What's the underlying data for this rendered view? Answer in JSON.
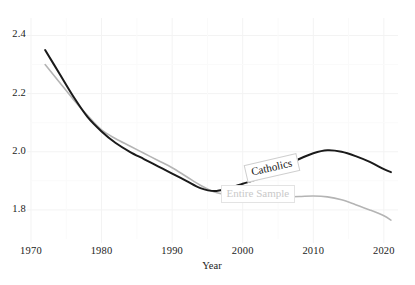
{
  "chart_data": {
    "type": "line",
    "title": "",
    "subtitle": "",
    "xlabel": "Year",
    "ylabel": "",
    "xlim": [
      1970,
      2022
    ],
    "ylim": [
      1.7,
      2.46
    ],
    "grid": true,
    "grid_style": "faint-light-gray",
    "legend_position": "inline-annotations",
    "xticks": [
      1970,
      1980,
      1990,
      2000,
      2010,
      2020
    ],
    "xtick_labels": [
      "1970",
      "1980",
      "1990",
      "2000",
      "2010",
      "2020"
    ],
    "yticks": [
      1.8,
      2.0,
      2.2,
      2.4
    ],
    "ytick_labels": [
      "1.8",
      "2.0",
      "2.2",
      "2.4"
    ],
    "series": [
      {
        "name": "Catholics",
        "color": "#1a1a1a",
        "linewidth": 2.0,
        "x": [
          1972,
          1974,
          1976,
          1978,
          1980,
          1982,
          1984,
          1986,
          1988,
          1990,
          1992,
          1994,
          1996,
          1998,
          2000,
          2002,
          2004,
          2006,
          2008,
          2010,
          2012,
          2014,
          2016,
          2018,
          2020,
          2021
        ],
        "values": [
          2.35,
          2.27,
          2.19,
          2.12,
          2.07,
          2.03,
          2.0,
          1.975,
          1.95,
          1.925,
          1.9,
          1.875,
          1.865,
          1.875,
          1.89,
          1.905,
          1.925,
          1.95,
          1.975,
          1.995,
          2.005,
          2.0,
          1.985,
          1.965,
          1.94,
          1.93
        ]
      },
      {
        "name": "Entire Sample",
        "color": "#b4b4b4",
        "linewidth": 1.6,
        "x": [
          1972,
          1974,
          1976,
          1978,
          1980,
          1982,
          1984,
          1986,
          1988,
          1990,
          1992,
          1994,
          1996,
          1998,
          2000,
          2002,
          2004,
          2006,
          2008,
          2010,
          2012,
          2014,
          2016,
          2018,
          2020,
          2021
        ],
        "values": [
          2.3,
          2.24,
          2.18,
          2.125,
          2.075,
          2.045,
          2.02,
          1.995,
          1.97,
          1.945,
          1.915,
          1.885,
          1.862,
          1.852,
          1.848,
          1.846,
          1.845,
          1.845,
          1.846,
          1.848,
          1.845,
          1.835,
          1.818,
          1.8,
          1.78,
          1.765
        ]
      }
    ],
    "annotations": [
      {
        "name": "Catholics",
        "text": "Catholics",
        "x_px": 272,
        "y_px": 168,
        "rotation": -13
      },
      {
        "name": "Entire Sample",
        "text": "Entire Sample",
        "x_px": 258,
        "y_px": 194,
        "rotation": 0
      }
    ]
  },
  "axes": {
    "x_axis_title": "Year",
    "plot_left_px": 31,
    "plot_right_px": 398,
    "plot_top_px": 18,
    "plot_bottom_px": 239
  },
  "colors": {
    "catholics_line": "#1a1a1a",
    "entire_sample_line": "#b4b4b4",
    "grid": "#f3f3f3",
    "text": "#1b1b1b",
    "background": "#ffffff"
  }
}
